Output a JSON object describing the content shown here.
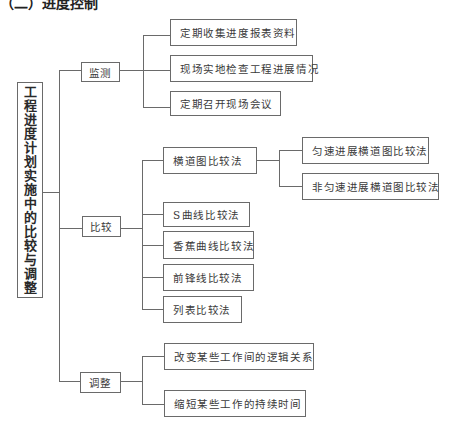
{
  "header": {
    "title_fragment": "（二）进度控制"
  },
  "root": {
    "label": "工程进度计划实施中的比较与调整"
  },
  "branches": [
    {
      "label": "监测",
      "children": [
        {
          "label": "定期收集进度报表资料"
        },
        {
          "label": "现场实地检查工程进展情况"
        },
        {
          "label": "定期召开现场会议"
        }
      ]
    },
    {
      "label": "比较",
      "children": [
        {
          "label": "横道图比较法",
          "children": [
            {
              "label": "匀速进展横道图比较法"
            },
            {
              "label": "非匀速进展横道图比较法"
            }
          ]
        },
        {
          "label": "S曲线比较法"
        },
        {
          "label": "香蕉曲线比较法"
        },
        {
          "label": "前锋线比较法"
        },
        {
          "label": "列表比较法"
        }
      ]
    },
    {
      "label": "调整",
      "children": [
        {
          "label": "改变某些工作间的逻辑关系"
        },
        {
          "label": "缩短某些工作的持续时间"
        }
      ]
    }
  ]
}
